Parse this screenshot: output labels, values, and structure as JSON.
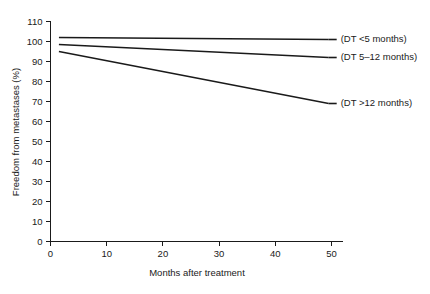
{
  "chart_data": {
    "type": "line",
    "title": "",
    "xlabel": "Months after treatment",
    "ylabel": "Freedom from metastases (%)",
    "xlim": [
      0,
      52
    ],
    "ylim": [
      0,
      110
    ],
    "xticks": [
      0,
      10,
      20,
      30,
      40,
      50
    ],
    "yticks": [
      0,
      10,
      20,
      30,
      40,
      50,
      60,
      70,
      80,
      90,
      100,
      110
    ],
    "xtick_labels": [
      "0",
      "10",
      "20",
      "30",
      "40",
      "50"
    ],
    "ytick_labels": [
      "0",
      "10",
      "20",
      "30",
      "40",
      "50",
      "60",
      "70",
      "80",
      "90",
      "100",
      "110"
    ],
    "grid": false,
    "legend_position": "right-of-line-ends",
    "line_color": "#1a1a1a",
    "background_color": "#ffffff",
    "x": [
      1.5,
      49.5
    ],
    "series": [
      {
        "name": "(DT <5 months)",
        "values": [
          102,
          101
        ],
        "label_y_value": 101
      },
      {
        "name": "(DT 5–12 months)",
        "values": [
          98.5,
          92
        ],
        "label_y_value": 92
      },
      {
        "name": "(DT >12 months)",
        "values": [
          95,
          69
        ],
        "label_y_value": 69
      }
    ]
  },
  "axes": {
    "x_title": "Months after treatment",
    "y_title": "Freedom from metastases (%)"
  },
  "legend": {
    "items": [
      {
        "label": "(DT <5 months)"
      },
      {
        "label": "(DT 5–12 months)"
      },
      {
        "label": "(DT >12 months)"
      }
    ]
  }
}
